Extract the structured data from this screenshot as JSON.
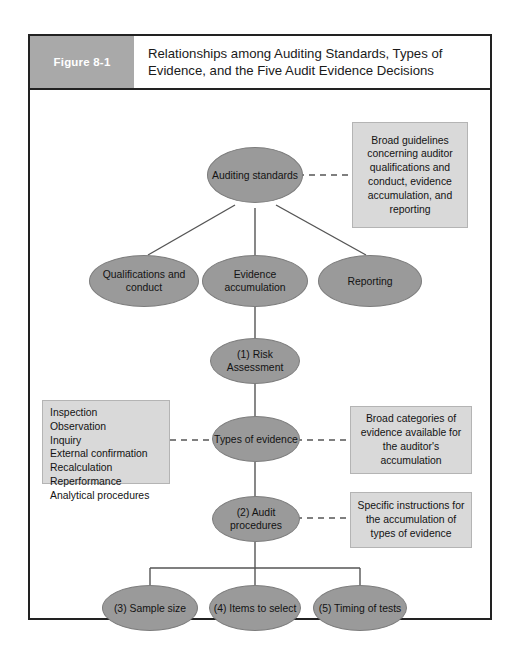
{
  "figure": {
    "label": "Figure 8-1",
    "title": "Relationships among Auditing Standards, Types of Evidence, and the Five Audit Evidence Decisions"
  },
  "colors": {
    "node_fill": "#9a9a9a",
    "callout_fill": "#d9d9d9",
    "label_band": "#a9a9a9",
    "frame_border": "#222222",
    "connector": "#555555"
  },
  "nodes": {
    "auditing_standards": "Auditing standards",
    "qualifications_conduct": "Qualifications and conduct",
    "evidence_accumulation": "Evidence accumulation",
    "reporting": "Reporting",
    "risk_assessment": "(1) Risk Assessment",
    "types_of_evidence": "Types of evidence",
    "audit_procedures": "(2) Audit procedures",
    "sample_size": "(3) Sample size",
    "items_to_select": "(4) Items to select",
    "timing_of_tests": "(5) Timing of tests"
  },
  "callouts": {
    "standards_note": "Broad guidelines concerning auditor qualifications and conduct, evidence accumulation, and reporting",
    "evidence_note": "Broad categories of evidence available for the auditor's accumulation",
    "procedures_note": "Specific instructions for the accumulation of types of evidence"
  },
  "evidence_types": {
    "items": [
      "Inspection",
      "Observation",
      "Inquiry",
      "External confirmation",
      "Recalculation",
      "Reperformance",
      "Analytical procedures"
    ]
  }
}
